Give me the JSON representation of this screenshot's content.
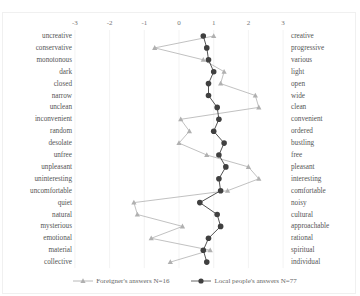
{
  "chart_data": {
    "type": "line",
    "orientation": "horizontal-profile",
    "title": "",
    "xlabel": "",
    "ylabel": "",
    "xlim": [
      -3,
      3
    ],
    "x_ticks": [
      -3,
      -2,
      -1,
      0,
      1,
      2,
      3
    ],
    "grid": true,
    "legend_position": "bottom",
    "left_labels": [
      "uncreative",
      "conservative",
      "monotonous",
      "dark",
      "closed",
      "narrow",
      "unclean",
      "inconvenient",
      "random",
      "desolate",
      "unfree",
      "unpleasant",
      "uninteresting",
      "uncomfortable",
      "quiet",
      "natural",
      "mysterious",
      "emotional",
      "material",
      "collective"
    ],
    "right_labels": [
      "creative",
      "progressive",
      "various",
      "light",
      "open",
      "wide",
      "clean",
      "convenient",
      "ordered",
      "bustling",
      "free",
      "pleasant",
      "interesting",
      "comfortable",
      "noisy",
      "cultural",
      "approachable",
      "rational",
      "spiritual",
      "individual"
    ],
    "series": [
      {
        "name": "Foreigner's answers N=16",
        "marker": "triangle",
        "color": "#a6a6a6",
        "values": [
          1.0,
          -0.7,
          0.7,
          1.3,
          1.2,
          2.2,
          2.3,
          0.05,
          0.3,
          0.0,
          0.8,
          2.0,
          2.3,
          1.4,
          -1.3,
          -1.2,
          0.1,
          -0.8,
          0.9,
          -0.25
        ]
      },
      {
        "name": "Local people's answers N=77",
        "marker": "circle",
        "color": "#404040",
        "values": [
          0.7,
          0.8,
          0.85,
          1.0,
          0.85,
          0.85,
          1.1,
          1.15,
          1.0,
          1.3,
          1.15,
          1.35,
          1.15,
          1.2,
          0.6,
          1.1,
          1.2,
          0.85,
          0.7,
          0.8
        ]
      }
    ]
  },
  "legend": {
    "foreigner": "Foreigner's answers N=16",
    "local": "Local people's answers N=77"
  }
}
